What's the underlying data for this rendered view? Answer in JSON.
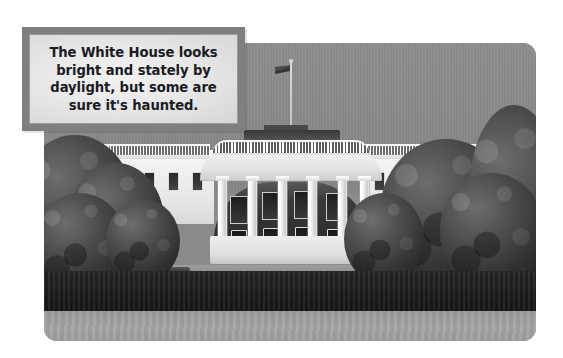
{
  "page": {
    "type": "captioned-photograph",
    "background_color": "#ffffff"
  },
  "photo": {
    "name": "white-house-south-facade",
    "subject": "The White House",
    "view": "South Portico seen from the South Lawn",
    "treatment": "black-and-white",
    "sky_color": "#8a8a8a",
    "lawn_color": "#9e9e9e",
    "hedge_color": "#232323",
    "building_color": "#efefef",
    "corner_radius_px": 13,
    "elements": {
      "flag_label": "american-flag",
      "flagpole_label": "flagpole",
      "portico_label": "south-portico-columns",
      "hedge_label": "boxwood-hedge",
      "lawn_label": "south-lawn",
      "left_tree_label": "left-tree-cluster",
      "right_tree_label": "right-tree-cluster"
    }
  },
  "caption": {
    "text": "The White House looks\nbright and stately by\ndaylight, but some are\nsure it's haunted.",
    "lines": [
      "The White House looks",
      "bright and stately by",
      "daylight, but some are",
      "sure it's haunted."
    ],
    "border_color": "#7f7f7f",
    "panel_color": "#e8e8e8",
    "text_color": "#1b1b23",
    "align": "center",
    "weight": "bold"
  }
}
